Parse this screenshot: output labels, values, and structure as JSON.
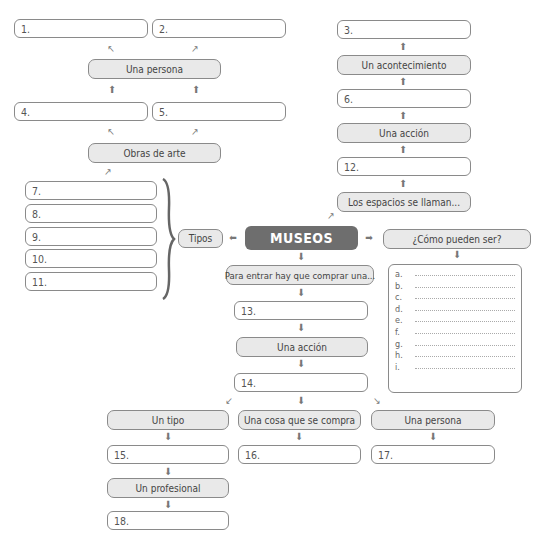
{
  "center": {
    "label": "MUSEOS"
  },
  "labels": {
    "una_persona_top": "Una persona",
    "obras_de_arte": "Obras de arte",
    "un_acontecimiento": "Un acontecimiento",
    "una_accion_top": "Una acción",
    "los_espacios": "Los espacios se llaman...",
    "tipos": "Tipos",
    "como_pueden_ser": "¿Cómo pueden ser?",
    "para_entrar": "Para entrar hay que comprar una...",
    "una_accion_mid": "Una acción",
    "un_tipo": "Un tipo",
    "una_cosa": "Una cosa que se compra",
    "una_persona_bottom": "Una persona",
    "un_profesional": "Un profesional"
  },
  "blanks": {
    "b1": "1.",
    "b2": "2.",
    "b3": "3.",
    "b4": "4.",
    "b5": "5.",
    "b6": "6.",
    "b7": "7.",
    "b8": "8.",
    "b9": "9.",
    "b10": "10.",
    "b11": "11.",
    "b12": "12.",
    "b13": "13.",
    "b14": "14.",
    "b15": "15.",
    "b16": "16.",
    "b17": "17.",
    "b18": "18."
  },
  "list": {
    "items": [
      "a.",
      "b.",
      "c.",
      "d.",
      "e.",
      "f.",
      "g.",
      "h.",
      "i."
    ]
  }
}
